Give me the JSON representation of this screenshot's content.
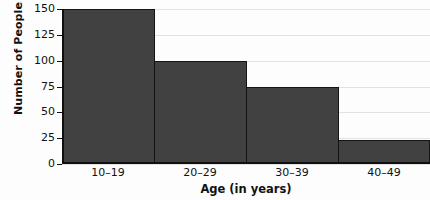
{
  "chart_data": {
    "type": "bar",
    "title": "",
    "categories": [
      "10–19",
      "20–29",
      "30–39",
      "40–49"
    ],
    "values": [
      150,
      100,
      75,
      23
    ],
    "xlabel": "Age (in years)",
    "ylabel": "Number of People",
    "ylim": [
      0,
      150
    ],
    "yticks": [
      0,
      25,
      50,
      75,
      100,
      125,
      150
    ],
    "ytick_labels": [
      "0",
      "25",
      "50",
      "75",
      "100",
      "125",
      "150"
    ],
    "grid": true,
    "legend": false,
    "bar_color": "#414141",
    "bar_edge_color": "#141414",
    "gridline_color": "#e2e2e2",
    "axis_color": "#101010",
    "background_color": "#fdfdfd"
  }
}
